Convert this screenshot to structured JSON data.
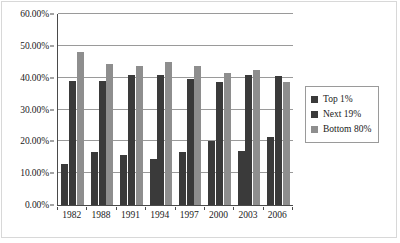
{
  "chart_data": {
    "type": "bar",
    "title": "",
    "xlabel": "",
    "ylabel": "",
    "categories": [
      "1982",
      "1988",
      "1991",
      "1994",
      "1997",
      "2000",
      "2003",
      "2006"
    ],
    "series": [
      {
        "name": "Top 1%",
        "color": "#3a3a3a",
        "values": [
          12.8,
          16.6,
          15.7,
          14.3,
          16.6,
          20.0,
          16.9,
          21.3
        ]
      },
      {
        "name": "Next 19%",
        "color": "#3a3a3a",
        "values": [
          39.0,
          38.9,
          40.9,
          40.9,
          39.7,
          38.8,
          40.9,
          40.4
        ]
      },
      {
        "name": "Bottom 80%",
        "color": "#8e8e8e",
        "values": [
          48.2,
          44.4,
          43.7,
          44.9,
          43.8,
          41.5,
          42.3,
          38.5
        ]
      }
    ],
    "ylim": [
      0,
      60
    ],
    "ytick_values": [
      0,
      10,
      20,
      30,
      40,
      50,
      60
    ],
    "ytick_labels": [
      "0.00%",
      "10.00%",
      "20.00%",
      "30.00%",
      "40.00%",
      "50.00%",
      "60.00%"
    ],
    "grid": true,
    "legend_position": "right"
  }
}
